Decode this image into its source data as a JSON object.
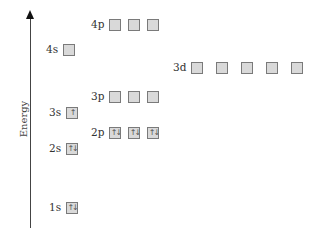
{
  "axis": {
    "label": "Energy",
    "direction": "up"
  },
  "colors": {
    "box_fill": "#d9d9d9",
    "box_border": "#7a7a7a",
    "axis": "#444444",
    "text": "#333333"
  },
  "levels": [
    {
      "label": "1s",
      "x": 49,
      "y": 201,
      "gap": 0,
      "boxes": [
        "↑↓"
      ]
    },
    {
      "label": "2s",
      "x": 49,
      "y": 142,
      "gap": 0,
      "boxes": [
        "↑↓"
      ]
    },
    {
      "label": "2p",
      "x": 91,
      "y": 126,
      "gap": 7,
      "boxes": [
        "↑↓",
        "↑↓",
        "↑↓"
      ]
    },
    {
      "label": "3s",
      "x": 49,
      "y": 106,
      "gap": 0,
      "boxes": [
        "↑"
      ]
    },
    {
      "label": "3p",
      "x": 91,
      "y": 90,
      "gap": 7,
      "boxes": [
        "",
        "",
        ""
      ]
    },
    {
      "label": "3d",
      "x": 173,
      "y": 61,
      "gap": 13,
      "boxes": [
        "",
        "",
        "",
        "",
        ""
      ]
    },
    {
      "label": "4s",
      "x": 46,
      "y": 43,
      "gap": 0,
      "boxes": [
        ""
      ]
    },
    {
      "label": "4p",
      "x": 91,
      "y": 18,
      "gap": 7,
      "boxes": [
        "",
        "",
        ""
      ]
    }
  ]
}
